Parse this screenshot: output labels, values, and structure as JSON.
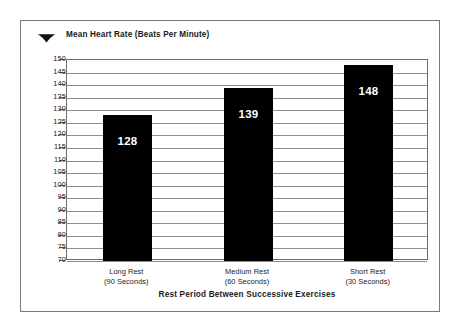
{
  "legend": {
    "marker_icon": "hexagon-marker-icon",
    "marker_color": "#111111",
    "label": "Mean Heart Rate (Beats Per Minute)"
  },
  "chart_data": {
    "type": "bar",
    "title": "Mean Heart Rate (Beats Per Minute)",
    "xlabel": "Rest Period Between Successive Exercises",
    "ylabel": "",
    "categories": [
      "Long Rest\n(90 Seconds)",
      "Medium Rest\n(60 Seconds)",
      "Short Rest\n(30 Seconds)"
    ],
    "category_lines": [
      {
        "line1": "Long Rest",
        "line2": "(90 Seconds)"
      },
      {
        "line1": "Medium Rest",
        "line2": "(60 Seconds)"
      },
      {
        "line1": "Short Rest",
        "line2": "(30 Seconds)"
      }
    ],
    "values": [
      128,
      139,
      148
    ],
    "value_labels": [
      "128",
      "139",
      "148"
    ],
    "series": [
      {
        "name": "Mean Heart Rate (Beats Per Minute)",
        "values": [
          128,
          139,
          148
        ]
      }
    ],
    "ylim": [
      70,
      150
    ],
    "ytick_step": 5,
    "yticks": [
      150,
      145,
      140,
      135,
      130,
      125,
      120,
      115,
      110,
      105,
      100,
      95,
      90,
      85,
      80,
      75,
      70
    ],
    "ytick_labels": [
      "150",
      "145",
      "140",
      "135",
      "130",
      "125",
      "120",
      "115",
      "110",
      "105",
      "100",
      "95",
      "90",
      "85",
      "80",
      "75",
      "70"
    ],
    "grid": true,
    "grid_axis": "y",
    "legend_position": "top-left",
    "bar_color": "#000000",
    "bar_label_color": "#ffffff",
    "frame_color": "#6d6d6d",
    "gridline_color": "#8d8d8d"
  },
  "axis_titles": {
    "x": "Rest Period Between Successive Exercises"
  }
}
